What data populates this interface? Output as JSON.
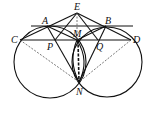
{
  "diagram": {
    "type": "geometry",
    "points": {
      "E": {
        "label": "E",
        "x": 77,
        "y": 13
      },
      "A": {
        "label": "A",
        "x": 47,
        "y": 26
      },
      "B": {
        "label": "B",
        "x": 106,
        "y": 26
      },
      "C": {
        "label": "C",
        "x": 20,
        "y": 40
      },
      "D": {
        "label": "D",
        "x": 131,
        "y": 40
      },
      "M": {
        "label": "M",
        "x": 77,
        "y": 40
      },
      "P": {
        "label": "P",
        "x": 55,
        "y": 40
      },
      "Q": {
        "label": "Q",
        "x": 98,
        "y": 40
      },
      "N": {
        "label": "N",
        "x": 79,
        "y": 82
      }
    },
    "circles": [
      {
        "name": "left-circle",
        "cx": 50,
        "cy": 62,
        "r": 36
      },
      {
        "name": "right-circle",
        "cx": 106,
        "cy": 62,
        "r": 36
      }
    ],
    "colors": {
      "stroke": "#111111",
      "dashed": "#555555"
    }
  }
}
